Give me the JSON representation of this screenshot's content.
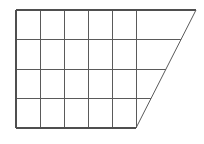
{
  "figure": {
    "background_color": "#ffffff",
    "line_color": "#5a5a5a",
    "outline_color": "#4f4f4f",
    "canvas": {
      "width": 204,
      "height": 144
    }
  },
  "chart_data": {
    "type": "diagram",
    "shape": "right trapezoid",
    "grid": {
      "columns": 5,
      "rows": 4,
      "cell_width": 24,
      "cell_height": 29.5,
      "left": 16,
      "right": 136,
      "top": 10,
      "bottom": 128
    },
    "vertices": {
      "top_left": [
        16,
        10
      ],
      "top_right": [
        196,
        10
      ],
      "bottom_right": [
        136,
        128
      ],
      "bottom_left": [
        16,
        128
      ]
    },
    "vertical_lines_x": [
      16,
      40,
      64,
      88,
      112,
      136
    ],
    "horizontal_lines": [
      {
        "y": 10,
        "x_start": 16,
        "x_end": 196
      },
      {
        "y": 39.5,
        "x_start": 16,
        "x_end": 181
      },
      {
        "y": 69,
        "x_start": 16,
        "x_end": 166
      },
      {
        "y": 98.5,
        "x_start": 16,
        "x_end": 151
      },
      {
        "y": 128,
        "x_start": 16,
        "x_end": 136
      }
    ],
    "slant_edge": {
      "from": [
        196,
        10
      ],
      "to": [
        136,
        128
      ]
    },
    "annotations": [],
    "labels": []
  }
}
